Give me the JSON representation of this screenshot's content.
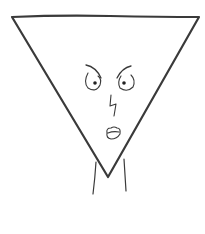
{
  "image": {
    "description": "Hand-drawn inverted triangle character with an angry face and neck lines",
    "background": "#ffffff",
    "stroke_color": "#3a3a3a",
    "subject": "angry-triangle-character"
  },
  "character": {
    "body_shape": "inverted-triangle",
    "expression": "angry",
    "features": [
      "eyebrows",
      "eyes",
      "nose",
      "mouth",
      "neck"
    ]
  }
}
